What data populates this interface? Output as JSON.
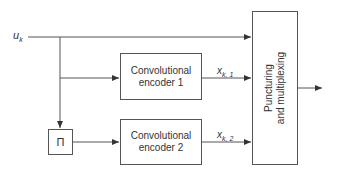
{
  "diagram": {
    "input": {
      "symbol": "u",
      "subscript": "k"
    },
    "interleaver": {
      "label": "Π"
    },
    "encoder1": {
      "line1": "Convolutional",
      "line2": "encoder 1"
    },
    "encoder2": {
      "line1": "Convolutional",
      "line2": "encoder 2"
    },
    "output1": {
      "symbol": "x",
      "subscript": "k, 1"
    },
    "output2": {
      "symbol": "x",
      "subscript": "k, 2"
    },
    "mux": {
      "line1": "Puncturing",
      "line2": "and multiplexing"
    },
    "colors": {
      "line": "#444444",
      "box_border": "#555555",
      "text": "#333333"
    }
  }
}
